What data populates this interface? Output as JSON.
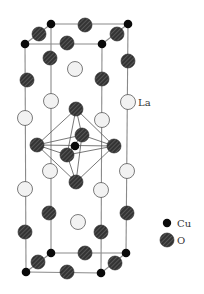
{
  "diagram": {
    "colors": {
      "line": "#8a8a8a",
      "octa_line": "#555555",
      "cu_fill": "#0a0a0a",
      "o_fill": "#3a3a3a",
      "o_stripe": "#6a6a6a",
      "la_fill": "#f2f2f2",
      "la_stroke": "#444444"
    },
    "labels": {
      "la": "La",
      "cu": "Cu",
      "o": "O"
    },
    "legend": [
      {
        "species": "Cu",
        "label": "Cu"
      },
      {
        "species": "O",
        "label": "O"
      }
    ],
    "cell_edges": [
      [
        25,
        44,
        102,
        44
      ],
      [
        51,
        24,
        128,
        24
      ],
      [
        25,
        44,
        51,
        24
      ],
      [
        102,
        44,
        128,
        24
      ],
      [
        26,
        272,
        101,
        273
      ],
      [
        51,
        253,
        126,
        253
      ],
      [
        26,
        272,
        51,
        253
      ],
      [
        101,
        273,
        126,
        253
      ],
      [
        25,
        44,
        26,
        272
      ],
      [
        51,
        24,
        51,
        253
      ],
      [
        102,
        44,
        101,
        273
      ],
      [
        128,
        24,
        126,
        253
      ]
    ],
    "octahedron_edges": [
      [
        76,
        109,
        37,
        145
      ],
      [
        76,
        109,
        114,
        146
      ],
      [
        76,
        109,
        82,
        135
      ],
      [
        76,
        109,
        67,
        155
      ],
      [
        76,
        182,
        37,
        145
      ],
      [
        76,
        182,
        114,
        146
      ],
      [
        76,
        182,
        82,
        135
      ],
      [
        76,
        182,
        67,
        155
      ],
      [
        37,
        145,
        82,
        135
      ],
      [
        82,
        135,
        114,
        146
      ],
      [
        114,
        146,
        67,
        155
      ],
      [
        67,
        155,
        37,
        145
      ],
      [
        37,
        145,
        114,
        146
      ],
      [
        82,
        135,
        67,
        155
      ]
    ],
    "atoms": {
      "La": [
        [
          75,
          69
        ],
        [
          51,
          101
        ],
        [
          128,
          102
        ],
        [
          25,
          118
        ],
        [
          102,
          120
        ],
        [
          50,
          171
        ],
        [
          127,
          171
        ],
        [
          25,
          189
        ],
        [
          101,
          190
        ],
        [
          78,
          222
        ]
      ],
      "O": [
        [
          85,
          25
        ],
        [
          39,
          34
        ],
        [
          117,
          34
        ],
        [
          67,
          43
        ],
        [
          50,
          58
        ],
        [
          128,
          61
        ],
        [
          27,
          80
        ],
        [
          102,
          79
        ],
        [
          76,
          109
        ],
        [
          82,
          135
        ],
        [
          37,
          145
        ],
        [
          114,
          146
        ],
        [
          67,
          155
        ],
        [
          76,
          182
        ],
        [
          49,
          213
        ],
        [
          127,
          213
        ],
        [
          25,
          232
        ],
        [
          101,
          232
        ],
        [
          85,
          253
        ],
        [
          38,
          262
        ],
        [
          115,
          263
        ],
        [
          67,
          272
        ]
      ],
      "Cu": [
        [
          51,
          24
        ],
        [
          128,
          24
        ],
        [
          25,
          44
        ],
        [
          102,
          44
        ],
        [
          75,
          146
        ],
        [
          51,
          253
        ],
        [
          126,
          253
        ],
        [
          26,
          272
        ],
        [
          101,
          273
        ]
      ]
    }
  }
}
